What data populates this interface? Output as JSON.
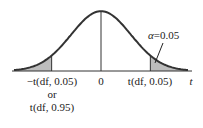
{
  "chart_data": {
    "type": "area",
    "title": "",
    "distribution": "t-distribution density (symmetric, bell-shaped)",
    "xlabel": "t",
    "ylabel": "",
    "shaded_regions": [
      {
        "name": "left-tail",
        "from": "-inf",
        "to": "-t(df, 0.05)",
        "area": 0.05
      },
      {
        "name": "right-tail",
        "from": "t(df, 0.05)",
        "to": "+inf",
        "area": 0.05
      }
    ],
    "x_range_sd": [
      -3.3,
      3.3
    ],
    "critical_value_sd": 1.645,
    "tick_labels": {
      "left": "−t(df, 0.05)",
      "left_or": "or",
      "left_alt": "t(df, 0.95)",
      "center": "0",
      "right": "t(df, 0.05)",
      "axis": "t"
    },
    "annotation": {
      "text": "α = 0.05",
      "alpha_symbol": "α",
      "alpha_value": "=0.05",
      "points_to": "right-tail"
    },
    "colors": {
      "curve": "#333333",
      "shade": "#bdbdbd",
      "axis": "#333333"
    }
  }
}
